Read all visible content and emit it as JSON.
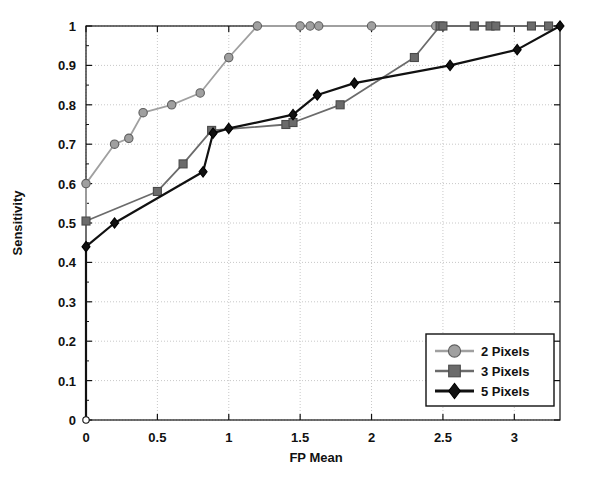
{
  "chart_data": {
    "type": "line",
    "title": "",
    "xlabel": "FP Mean",
    "ylabel": "Sensitivity",
    "xlim": [
      0,
      3.32
    ],
    "ylim": [
      0,
      1
    ],
    "xticks": [
      "0",
      "0.5",
      "1",
      "1.5",
      "2",
      "2.5",
      "3"
    ],
    "xtick_values": [
      0,
      0.5,
      1,
      1.5,
      2,
      2.5,
      3
    ],
    "yticks": [
      "0",
      "0.1",
      "0.2",
      "0.3",
      "0.4",
      "0.5",
      "0.6",
      "0.7",
      "0.8",
      "0.9",
      "1"
    ],
    "ytick_values": [
      0,
      0.1,
      0.2,
      0.3,
      0.4,
      0.5,
      0.6,
      0.7,
      0.8,
      0.9,
      1
    ],
    "grid": true,
    "legend_position": "lower right",
    "series": [
      {
        "name": "2 Pixels",
        "color": "#a0a0a0",
        "marker": "circle",
        "x": [
          0,
          0,
          0.2,
          0.3,
          0.4,
          0.6,
          0.8,
          1.0,
          1.2,
          1.5,
          1.57,
          1.63,
          2.0,
          2.45
        ],
        "y": [
          0,
          0.6,
          0.7,
          0.715,
          0.78,
          0.8,
          0.83,
          0.92,
          1.0,
          1.0,
          1.0,
          1.0,
          1.0,
          1.0
        ]
      },
      {
        "name": "3 Pixels",
        "color": "#6b6b6b",
        "marker": "square",
        "x": [
          0,
          0,
          0.5,
          0.68,
          0.88,
          1.4,
          1.45,
          1.78,
          2.3,
          2.48,
          2.5,
          2.72,
          2.83,
          2.87,
          3.12,
          3.24
        ],
        "y": [
          0,
          0.505,
          0.58,
          0.65,
          0.735,
          0.75,
          0.755,
          0.8,
          0.92,
          1.0,
          1.0,
          1.0,
          1.0,
          1.0,
          1.0,
          1.0
        ]
      },
      {
        "name": "5 Pixels",
        "color": "#111111",
        "marker": "diamond",
        "x": [
          0,
          0,
          0.2,
          0.82,
          0.89,
          1.0,
          1.45,
          1.62,
          1.88,
          2.55,
          3.02,
          3.32
        ],
        "y": [
          0,
          0.44,
          0.5,
          0.63,
          0.728,
          0.74,
          0.775,
          0.825,
          0.855,
          0.9,
          0.94,
          1.0
        ]
      }
    ]
  },
  "legend": {
    "entries": [
      {
        "label": "2 Pixels"
      },
      {
        "label": "3 Pixels"
      },
      {
        "label": "5 Pixels"
      }
    ]
  },
  "colors": {
    "series_2px": "#a0a0a0",
    "series_3px": "#6b6b6b",
    "series_5px": "#111111",
    "grid": "#c8c8c8",
    "axis": "#111111",
    "background": "#ffffff"
  }
}
